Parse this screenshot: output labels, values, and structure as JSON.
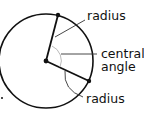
{
  "diagram": {
    "labels": {
      "radius_top": "radius",
      "central_line1": "central",
      "central_line2": "angle",
      "radius_bottom": "radius"
    },
    "colors": {
      "stroke": "#111111",
      "leader": "#333333",
      "arc": "#bbbbbb"
    }
  }
}
